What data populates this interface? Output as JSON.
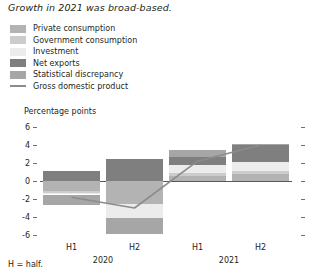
{
  "title": "Growth in 2021 was broad-based.",
  "footnote": "H = half.",
  "axis_unit": "Percentage points",
  "legend": {
    "items": [
      {
        "label": "Private consumption",
        "color": "#b3b3b3",
        "type": "swatch",
        "icon": "square-swatch-icon"
      },
      {
        "label": "Government consumption",
        "color": "#cccccc",
        "type": "swatch",
        "icon": "square-swatch-icon"
      },
      {
        "label": "Investment",
        "color": "#ececec",
        "type": "swatch",
        "icon": "square-swatch-icon"
      },
      {
        "label": "Net exports",
        "color": "#7f7f7f",
        "type": "swatch",
        "icon": "square-swatch-icon"
      },
      {
        "label": "Statistical discrepancy",
        "color": "#a6a6a6",
        "type": "swatch",
        "icon": "square-swatch-icon"
      },
      {
        "label": "Gross domestic product",
        "color": "#8c8c8c",
        "type": "line",
        "icon": "line-swatch-icon"
      }
    ]
  },
  "chart_data": {
    "type": "bar",
    "subtype": "stacked-bar-with-line",
    "title": "Growth in 2021 was broad-based.",
    "xlabel": "",
    "ylabel": "Percentage points",
    "ylim": [
      -6,
      6
    ],
    "yticks": [
      6,
      4,
      2,
      0,
      -2,
      -4,
      -6
    ],
    "ytick_labels": [
      "6",
      "4",
      "2",
      "0",
      "-2",
      "-4",
      "-6"
    ],
    "grid": false,
    "legend_position": "top-left",
    "categories": [
      "H1",
      "H2",
      "H1",
      "H2"
    ],
    "period_groups": [
      {
        "label": "2020",
        "categories": [
          "H1",
          "H2"
        ]
      },
      {
        "label": "2021",
        "categories": [
          "H1",
          "H2"
        ]
      }
    ],
    "series": [
      {
        "name": "Private consumption",
        "color": "#b3b3b3",
        "values": [
          -1.1,
          -2.5,
          0.6,
          0.8
        ]
      },
      {
        "name": "Government consumption",
        "color": "#cccccc",
        "values": [
          -0.2,
          0.0,
          0.3,
          0.3
        ]
      },
      {
        "name": "Investment",
        "color": "#ececec",
        "values": [
          -0.2,
          -1.6,
          0.9,
          1.0
        ]
      },
      {
        "name": "Net exports",
        "color": "#7f7f7f",
        "values": [
          1.1,
          2.5,
          0.9,
          1.9
        ]
      },
      {
        "name": "Statistical discrepancy",
        "color": "#a6a6a6",
        "values": [
          -1.2,
          -1.8,
          0.8,
          0.1
        ]
      }
    ],
    "line_series": {
      "name": "Gross domestic product",
      "color": "#8c8c8c",
      "values": [
        -1.8,
        -3.0,
        2.2,
        4.0
      ]
    }
  }
}
